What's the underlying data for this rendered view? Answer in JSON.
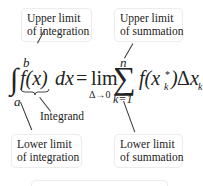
{
  "diagram": {
    "callouts": {
      "upper_integration": {
        "line1": "Upper limit",
        "line2": "of integration"
      },
      "upper_summation": {
        "line1": "Upper limit",
        "line2": "of summation"
      },
      "lower_integration": {
        "line1": "Lower limit",
        "line2": "of integration"
      },
      "lower_summation": {
        "line1": "Lower limit",
        "line2": "of summation"
      },
      "integrand": "Integrand"
    },
    "formula": {
      "integral_sign": "∫",
      "upper_bound": "b",
      "lower_bound": "a",
      "integrand": "f(x)",
      "differential": "dx",
      "equals": "=",
      "lim": "lim",
      "lim_sub": "Δ→0",
      "sigma": "∑",
      "sum_upper": "n",
      "sum_lower": "k=1",
      "term_f": "f(x",
      "term_sub": "k",
      "term_sup": "*",
      "term_close": ")",
      "delta": "Δ",
      "term_x": "x",
      "term_x_sub": "k"
    }
  }
}
